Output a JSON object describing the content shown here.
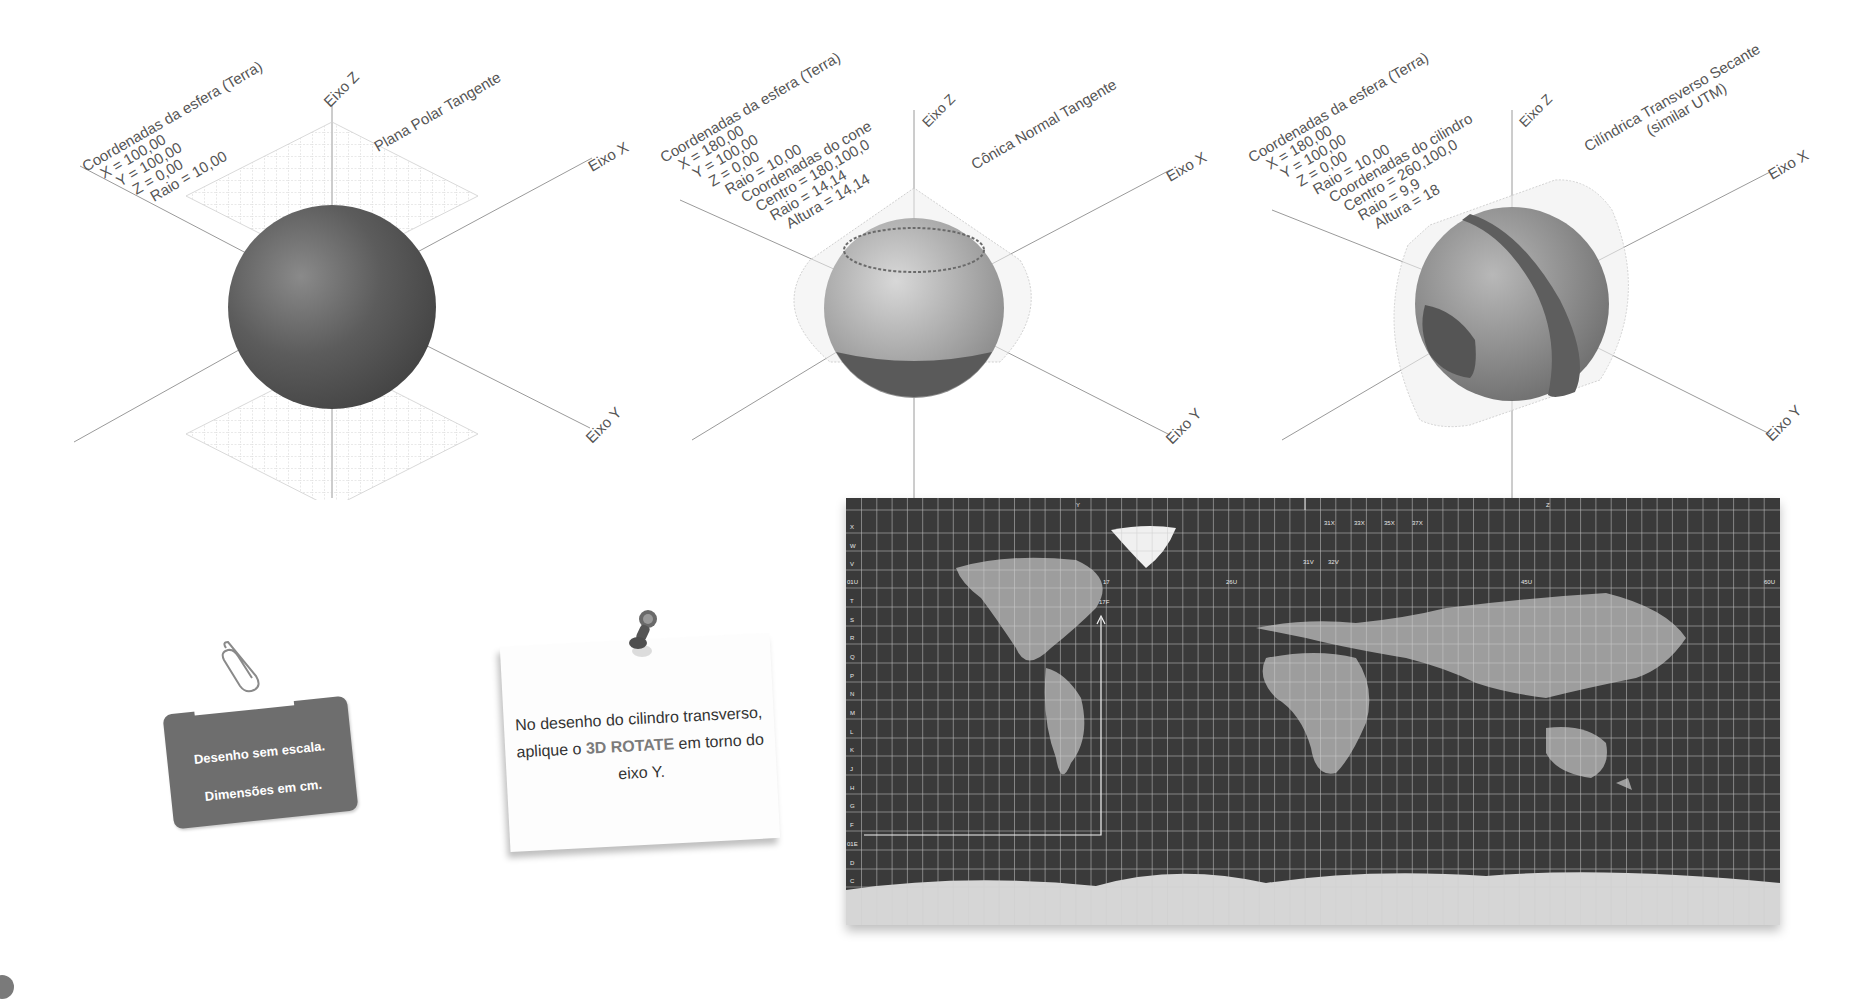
{
  "diagrams": [
    {
      "title": "Plana Polar Tangente",
      "info_lines": [
        "Coordenadas da esfera (Terra)",
        "X = 100,00",
        "Y = 100,00",
        "Z = 0,00",
        "Raio = 10,00"
      ],
      "axes": {
        "z": "Eixo Z",
        "x": "Eixo X",
        "y": "Eixo Y"
      }
    },
    {
      "title": "Cônica Normal Tangente",
      "info_lines": [
        "Coordenadas da esfera (Terra)",
        "X = 180,00",
        "Y = 100,00",
        "Z = 0,00",
        "Raio = 10,00",
        "Coordenadas do cone",
        "Centro = 180,100,0",
        "Raio = 14,14",
        "Altura = 14,14"
      ],
      "axes": {
        "z": "Eixo Z",
        "x": "Eixo X",
        "y": "Eixo Y"
      }
    },
    {
      "title": "Cilíndrica Transverso Secante",
      "subtitle": "(similar UTM)",
      "info_lines": [
        "Coordenadas da esfera (Terra)",
        "X = 180,00",
        "Y = 100,00",
        "Z = 0,00",
        "Raio = 10,00",
        "Coordenadas do cilindro",
        "Centro = 260,100,0",
        "Raio = 9,9",
        "Altura = 18"
      ],
      "axes": {
        "z": "Eixo Z",
        "x": "Eixo X",
        "y": "Eixo Y"
      }
    }
  ],
  "notes": {
    "tag_card": {
      "line1": "Desenho sem escala.",
      "line2": "Dimensões em cm.",
      "icon": "paperclip-icon"
    },
    "sticky_note": {
      "text_before": "No desenho do cilindro transverso, aplique o ",
      "highlight": "3D ROTATE",
      "text_after": " em torno do eixo Y.",
      "icon": "pushpin-icon"
    }
  },
  "utm_map": {
    "top_labels": [
      "Y",
      "Z"
    ],
    "row_letters": [
      "X",
      "W",
      "V",
      "T",
      "S",
      "R",
      "Q",
      "P",
      "N",
      "M",
      "L",
      "K",
      "J",
      "H",
      "G",
      "F",
      "D",
      "C"
    ],
    "zone_numbers": [
      "01U",
      "02",
      "03",
      "04",
      "05",
      "06",
      "07",
      "08",
      "09",
      "10",
      "11",
      "12",
      "13",
      "14",
      "15",
      "16",
      "17",
      "18",
      "19",
      "20",
      "21",
      "22",
      "23",
      "24",
      "25",
      "26U",
      "27",
      "28",
      "29",
      "30",
      "31",
      "32",
      "33",
      "34",
      "35",
      "36",
      "37",
      "38",
      "39",
      "40",
      "41",
      "42",
      "43",
      "44",
      "45U",
      "46",
      "47",
      "48",
      "49",
      "50",
      "51",
      "52",
      "53",
      "54",
      "55",
      "56",
      "57",
      "58",
      "59",
      "60U"
    ],
    "bottom_zone_numbers_start": "01E",
    "special_zones": [
      "31X",
      "33X",
      "35X",
      "37X",
      "31V",
      "32V"
    ],
    "marker_label": "17F",
    "colors": {
      "ocean": "#3a3a3a",
      "land": "#bdbdbd",
      "ice": "#f2f2f2",
      "grid": "#cfcfcf"
    }
  }
}
